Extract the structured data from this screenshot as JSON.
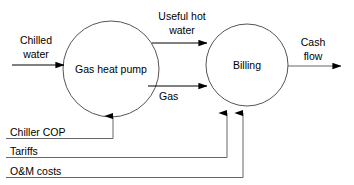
{
  "diagram": {
    "type": "flow-diagram",
    "stroke_color": "#000000",
    "background_color": "#ffffff",
    "nodes": [
      {
        "id": "gas-heat-pump",
        "label": "Gas heat pump",
        "shape": "circle",
        "cx": 111,
        "cy": 69,
        "r": 48
      },
      {
        "id": "billing",
        "label": "Billing",
        "shape": "circle",
        "cx": 247,
        "cy": 65,
        "r": 41
      }
    ],
    "flows": [
      {
        "id": "chilled-water",
        "label": "Chilled water",
        "line1": "Chilled",
        "line2": "water",
        "from": "external-left",
        "to": "gas-heat-pump"
      },
      {
        "id": "useful-hot-water",
        "label": "Useful hot water",
        "line1": "Useful hot",
        "line2": "water",
        "from": "gas-heat-pump",
        "to": "billing"
      },
      {
        "id": "gas",
        "label": "Gas",
        "line1": "Gas",
        "line2": "",
        "from": "gas-heat-pump",
        "to": "billing"
      },
      {
        "id": "cash-flow",
        "label": "Cash flow",
        "line1": "Cash",
        "line2": "flow",
        "from": "billing",
        "to": "external-right"
      }
    ],
    "inputs": [
      {
        "id": "chiller-cop",
        "label": "Chiller COP",
        "target": "gas-heat-pump"
      },
      {
        "id": "tariffs",
        "label": "Tariffs",
        "target": "billing"
      },
      {
        "id": "om-costs",
        "label": "O&M costs",
        "target": "billing"
      }
    ]
  }
}
